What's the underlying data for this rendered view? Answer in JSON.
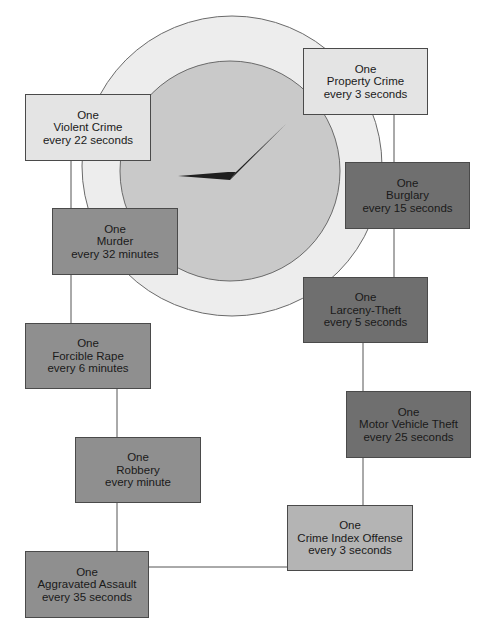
{
  "diagram": {
    "type": "crime-clock",
    "colors": {
      "outer_ring": "#ededed",
      "clock_face": "#c9c9c9",
      "hands": "#1f1f1f",
      "box_light": "#e4e4e4",
      "box_medium": "#8f8f8f",
      "box_dark": "#6f6f6f",
      "box_index": "#b4b4b4",
      "lines": "#555555"
    },
    "boxes": {
      "property_crime": {
        "line1": "One",
        "line2": "Property Crime",
        "line3": "every 3 seconds"
      },
      "violent_crime": {
        "line1": "One",
        "line2": "Violent Crime",
        "line3": "every 22 seconds"
      },
      "burglary": {
        "line1": "One",
        "line2": "Burglary",
        "line3": "every 15 seconds"
      },
      "murder": {
        "line1": "One",
        "line2": "Murder",
        "line3": "every 32 minutes"
      },
      "larceny_theft": {
        "line1": "One",
        "line2": "Larceny-Theft",
        "line3": "every 5 seconds"
      },
      "forcible_rape": {
        "line1": "One",
        "line2": "Forcible Rape",
        "line3": "every 6 minutes"
      },
      "motor_vehicle_theft": {
        "line1": "One",
        "line2": "Motor Vehicle Theft",
        "line3": "every 25 seconds"
      },
      "robbery": {
        "line1": "One",
        "line2": "Robbery",
        "line3": "every minute"
      },
      "crime_index_offense": {
        "line1": "One",
        "line2": "Crime Index Offense",
        "line3": "every 3 seconds"
      },
      "aggravated_assault": {
        "line1": "One",
        "line2": "Aggravated Assault",
        "line3": "every 35 seconds"
      }
    }
  }
}
